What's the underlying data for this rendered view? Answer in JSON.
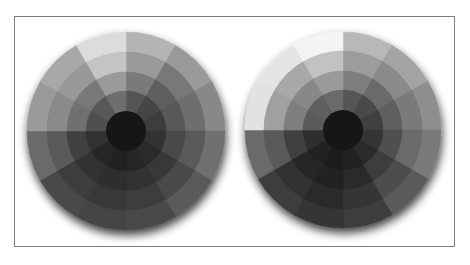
{
  "figure": {
    "frame_color": "#7c7c7c",
    "shadow_color": "#000000",
    "wheels": [
      {
        "name": "left-wheel",
        "cx": 126,
        "cy": 131,
        "ring_radii": [
          99,
          79,
          59,
          40,
          20
        ],
        "sectors": 12,
        "rings": [
          [
            "#b4b4b4",
            "#9a9a9a",
            "#888888",
            "#707070",
            "#5a5a5a",
            "#4a4a4a",
            "#454545",
            "#484848",
            "#6a6a6a",
            "#9a9a9a",
            "#a8a8a8",
            "#dcdcdc"
          ],
          [
            "#9a9a9a",
            "#787878",
            "#6e6e6e",
            "#5a5a5a",
            "#484848",
            "#3c3c3c",
            "#383838",
            "#3c3c3c",
            "#5a5a5a",
            "#8a8a8a",
            "#989898",
            "#c4c4c4"
          ],
          [
            "#7a7a7a",
            "#5e5e5e",
            "#585858",
            "#484848",
            "#383838",
            "#303030",
            "#2e2e2e",
            "#323232",
            "#404040",
            "#707070",
            "#787878",
            "#9a9a9a"
          ],
          [
            "#555555",
            "#444444",
            "#3e3e3e",
            "#333333",
            "#2a2a2a",
            "#252525",
            "#242424",
            "#262626",
            "#303030",
            "#505050",
            "#585858",
            "#6e6e6e"
          ]
        ],
        "center": "#141414"
      },
      {
        "name": "right-wheel",
        "cx": 343,
        "cy": 130,
        "ring_radii": [
          98,
          79,
          59,
          40,
          20
        ],
        "sectors": 12,
        "rings": [
          [
            "#b8b8b8",
            "#a4a4a4",
            "#8e8e8e",
            "#7a7a7a",
            "#5a5a5a",
            "#3c3c3c",
            "#343434",
            "#3e3e3e",
            "#6a6a6a",
            "#e2e2e2",
            "#e4e4e4",
            "#f4f4f4"
          ],
          [
            "#9c9c9c",
            "#8a8a8a",
            "#7a7a7a",
            "#6a6a6a",
            "#4e4e4e",
            "#343434",
            "#2c2c2c",
            "#303030",
            "#5a5a5a",
            "#a0a0a0",
            "#a8a8a8",
            "#c2c2c2"
          ],
          [
            "#7e7e7e",
            "#6a6a6a",
            "#5e5e5e",
            "#505050",
            "#3c3c3c",
            "#2a2a2a",
            "#242424",
            "#262626",
            "#404040",
            "#7e7e7e",
            "#888888",
            "#9a9a9a"
          ],
          [
            "#555555",
            "#484848",
            "#404040",
            "#363636",
            "#2c2c2c",
            "#222222",
            "#1e1e1e",
            "#202020",
            "#2e2e2e",
            "#5a5a5a",
            "#5e5e5e",
            "#6a6a6a"
          ]
        ],
        "center": "#121212"
      }
    ]
  }
}
